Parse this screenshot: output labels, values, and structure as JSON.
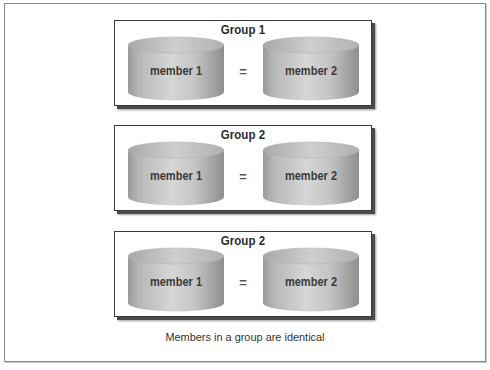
{
  "figure": {
    "caption": "Members in a group are identical",
    "equals_sign": "=",
    "colors": {
      "box_border": "#3a3a3a",
      "box_shadow": "#4a4a4a",
      "cylinder_body_light": "#d8d8d8",
      "cylinder_body_dark": "#9c9c9c",
      "cylinder_top": "#c4c4c4",
      "text": "#2a2a2a"
    },
    "groups": [
      {
        "title": "Group 1",
        "members": [
          {
            "label": "member 1",
            "icon": "disk-cylinder-icon"
          },
          {
            "label": "member 2",
            "icon": "disk-cylinder-icon"
          }
        ]
      },
      {
        "title": "Group 2",
        "members": [
          {
            "label": "member 1",
            "icon": "disk-cylinder-icon"
          },
          {
            "label": "member 2",
            "icon": "disk-cylinder-icon"
          }
        ]
      },
      {
        "title": "Group 2",
        "members": [
          {
            "label": "member 1",
            "icon": "disk-cylinder-icon"
          },
          {
            "label": "member 2",
            "icon": "disk-cylinder-icon"
          }
        ]
      }
    ]
  }
}
